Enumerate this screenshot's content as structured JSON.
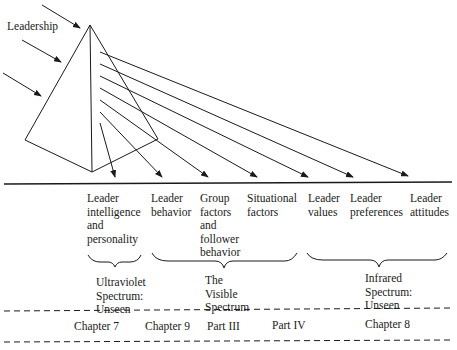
{
  "diagram": {
    "input_label": "Leadership",
    "components": [
      {
        "lines": [
          "Leader",
          "intelligence",
          "and",
          "personality"
        ]
      },
      {
        "lines": [
          "Leader",
          "behavior"
        ]
      },
      {
        "lines": [
          "Group",
          "factors",
          "and",
          "follower",
          "behavior"
        ]
      },
      {
        "lines": [
          "Situational",
          "factors"
        ]
      },
      {
        "lines": [
          "Leader",
          "values"
        ]
      },
      {
        "lines": [
          "Leader",
          "preferences"
        ]
      },
      {
        "lines": [
          "Leader",
          "attitudes"
        ]
      }
    ],
    "spectra": [
      {
        "lines": [
          "Ultraviolet",
          "Spectrum:",
          "Unseen"
        ]
      },
      {
        "lines": [
          "The",
          "Visible",
          "Spectrum"
        ]
      },
      {
        "lines": [
          "Infrared",
          "Spectrum:",
          "Unseen"
        ]
      }
    ],
    "chapters": [
      "Chapter 7",
      "Chapter 9",
      "Part III",
      "Part IV",
      "Chapter 8"
    ]
  }
}
